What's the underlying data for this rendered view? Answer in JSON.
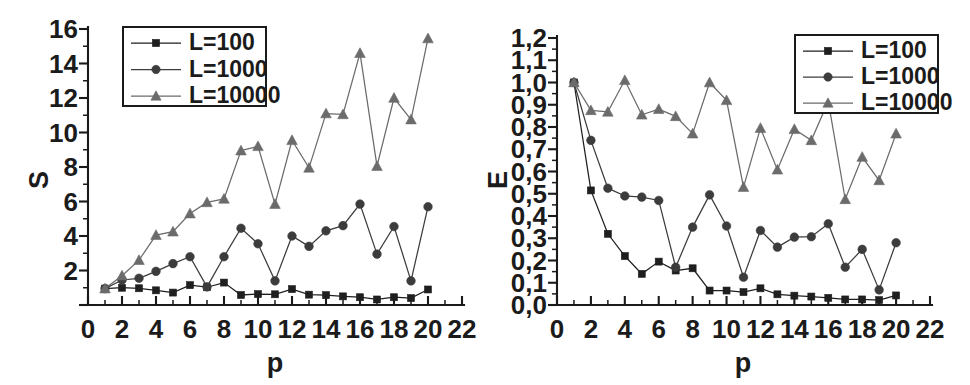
{
  "figure": {
    "panels": [
      {
        "id": "left",
        "ylabel": "S",
        "xlabel": "p"
      },
      {
        "id": "right",
        "ylabel": "E",
        "xlabel": "p"
      }
    ]
  },
  "colors": {
    "axis": "#1a1a1a",
    "text": "#1b1b1b",
    "series_L100": "#1f1f1f",
    "series_L1000": "#3c3c3c",
    "series_L10000": "#6b6b6b",
    "background": "#ffffff"
  },
  "legend": {
    "position": "top-left-panel-1 / top-right-panel-2",
    "entries": [
      {
        "label": "L=100",
        "marker": "square"
      },
      {
        "label": "L=1000",
        "marker": "circle"
      },
      {
        "label": "L=10000",
        "marker": "triangle"
      }
    ]
  },
  "chart_data": [
    {
      "type": "line",
      "title": "",
      "xlabel": "p",
      "ylabel": "S",
      "xlim": [
        0,
        22
      ],
      "ylim": [
        0,
        16
      ],
      "xticks": [
        0,
        2,
        4,
        6,
        8,
        10,
        12,
        14,
        16,
        18,
        20,
        22
      ],
      "xticklabels": [
        "0",
        "2",
        "4",
        "6",
        "8",
        "10",
        "12",
        "14",
        "16",
        "18",
        "20",
        "22"
      ],
      "yticks": [
        0,
        2,
        4,
        6,
        8,
        10,
        12,
        14,
        16
      ],
      "yticklabels": [
        "",
        "2",
        "4",
        "6",
        "8",
        "10",
        "12",
        "14",
        "16"
      ],
      "grid": false,
      "legend_position": "upper left",
      "x": [
        1,
        2,
        3,
        4,
        5,
        6,
        7,
        8,
        9,
        10,
        11,
        12,
        13,
        14,
        15,
        16,
        17,
        18,
        19,
        20
      ],
      "series": [
        {
          "name": "L=100",
          "marker": "square",
          "values": [
            0.95,
            1.0,
            0.97,
            0.85,
            0.72,
            1.15,
            1.03,
            1.3,
            0.58,
            0.63,
            0.62,
            0.92,
            0.6,
            0.57,
            0.5,
            0.45,
            0.32,
            0.45,
            0.4,
            0.9
          ]
        },
        {
          "name": "L=1000",
          "marker": "circle",
          "values": [
            0.95,
            1.45,
            1.55,
            1.95,
            2.4,
            2.8,
            1.05,
            2.8,
            4.45,
            3.55,
            1.4,
            4.0,
            3.4,
            4.3,
            4.6,
            5.85,
            2.95,
            4.55,
            1.4,
            5.7
          ]
        },
        {
          "name": "L=10000",
          "marker": "triangle",
          "values": [
            0.95,
            1.7,
            2.6,
            4.05,
            4.25,
            5.3,
            5.95,
            6.15,
            8.95,
            9.2,
            5.85,
            9.55,
            7.95,
            11.1,
            11.05,
            14.6,
            8.05,
            12.0,
            10.75,
            15.45
          ]
        }
      ]
    },
    {
      "type": "line",
      "title": "",
      "xlabel": "p",
      "ylabel": "E",
      "xlim": [
        0,
        22
      ],
      "ylim": [
        0.0,
        1.2
      ],
      "xticks": [
        0,
        2,
        4,
        6,
        8,
        10,
        12,
        14,
        16,
        18,
        20,
        22
      ],
      "xticklabels": [
        "0",
        "2",
        "4",
        "6",
        "8",
        "10",
        "12",
        "14",
        "16",
        "18",
        "20",
        "22"
      ],
      "yticks": [
        0.0,
        0.1,
        0.2,
        0.3,
        0.4,
        0.5,
        0.6,
        0.7,
        0.8,
        0.9,
        1.0,
        1.1,
        1.2
      ],
      "yticklabels": [
        "0,0",
        "0,1",
        "0,2",
        "0,3",
        "0,4",
        "0,5",
        "0,6",
        "0,7",
        "0,8",
        "0,9",
        "1,0",
        "1,1",
        "1,2"
      ],
      "grid": false,
      "legend_position": "upper right",
      "x": [
        1,
        2,
        3,
        4,
        5,
        6,
        7,
        8,
        9,
        10,
        11,
        12,
        13,
        14,
        15,
        16,
        17,
        18,
        19,
        20
      ],
      "series": [
        {
          "name": "L=100",
          "marker": "square",
          "values": [
            1.0,
            0.515,
            0.32,
            0.22,
            0.14,
            0.195,
            0.155,
            0.165,
            0.065,
            0.065,
            0.058,
            0.075,
            0.048,
            0.042,
            0.038,
            0.032,
            0.025,
            0.025,
            0.022,
            0.043
          ]
        },
        {
          "name": "L=1000",
          "marker": "circle",
          "values": [
            1.0,
            0.74,
            0.525,
            0.49,
            0.485,
            0.47,
            0.17,
            0.35,
            0.495,
            0.355,
            0.125,
            0.335,
            0.26,
            0.305,
            0.307,
            0.365,
            0.17,
            0.25,
            0.068,
            0.28
          ]
        },
        {
          "name": "L=10000",
          "marker": "triangle",
          "values": [
            1.0,
            0.875,
            0.868,
            1.01,
            0.855,
            0.88,
            0.848,
            0.77,
            1.0,
            0.92,
            0.53,
            0.795,
            0.608,
            0.79,
            0.74,
            0.915,
            0.475,
            0.665,
            0.56,
            0.77
          ]
        }
      ]
    }
  ]
}
